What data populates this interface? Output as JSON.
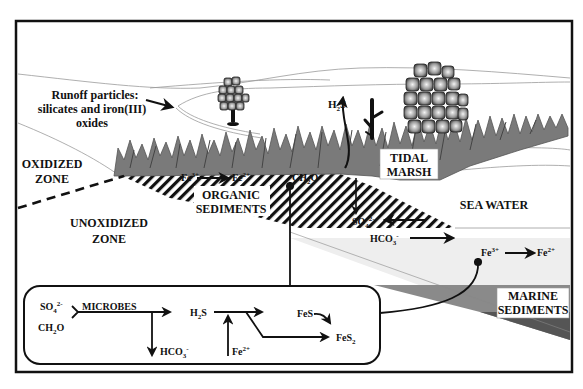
{
  "figure": {
    "type": "diagram"
  },
  "labels": {
    "runoff_line1": "Runoff particles:",
    "runoff_line2": "silicates and iron(III)",
    "runoff_line3": "oxides",
    "oxidized_line1": "OXIDIZED",
    "oxidized_line2": "ZONE",
    "unoxidized_line1": "UNOXIDIZED",
    "unoxidized_line2": "ZONE",
    "organic_line1": "ORGANIC",
    "organic_line2": "SEDIMENTS",
    "tidal_line1": "TIDAL",
    "tidal_line2": "MARSH",
    "sea_water": "SEA WATER",
    "marine_line1": "MARINE",
    "marine_line2": "SEDIMENTS"
  },
  "species": {
    "h2s_top": {
      "base": "H",
      "sub": "2",
      "tail": "S"
    },
    "fe3_marsh": {
      "base": "Fe",
      "sup": "3+"
    },
    "fe2_marsh": {
      "base": "Fe",
      "sup": "2+"
    },
    "ch2o_marsh": {
      "base": "CH",
      "sub": "2",
      "tail": "O"
    },
    "so4_sed": {
      "base": "SO",
      "sub": "4",
      "sup": "2-"
    },
    "hco3_sed": {
      "base": "HCO",
      "sub": "3",
      "sup": "-"
    },
    "fe3_sea": {
      "base": "Fe",
      "sup": "3+"
    },
    "fe2_sea": {
      "base": "Fe",
      "sup": "2+"
    }
  },
  "reaction_box": {
    "so4": {
      "base": "SO",
      "sub": "4",
      "sup": "2-"
    },
    "ch2o": {
      "base": "CH",
      "sub": "2",
      "tail": "O"
    },
    "microbes": "MICROBES",
    "hco3": {
      "base": "HCO",
      "sub": "3",
      "sup": "-"
    },
    "h2s": {
      "base": "H",
      "sub": "2",
      "tail": "S"
    },
    "fe2": {
      "base": "Fe",
      "sup": "2+"
    },
    "fes": "FeS",
    "fes2": {
      "base": "FeS",
      "sub": "2"
    }
  },
  "colors": {
    "ink": "#111111",
    "vegetation": "#7a7a7a",
    "vegetation_dark": "#555555",
    "marine_sediment_light": "#8a8a8a",
    "marine_sediment_dark": "#555555",
    "background": "#ffffff"
  }
}
